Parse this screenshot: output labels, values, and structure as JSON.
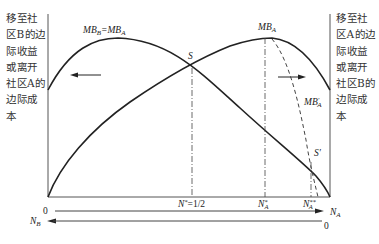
{
  "diagram": {
    "left_axis_label": "移至社区B的边际收益或离开社区A的边际成本",
    "right_axis_label": "移至社区A的边际收益或离开社区B的边际成本",
    "curves": [
      {
        "name": "MB_B=MB_A",
        "label": "MBB=MBA",
        "style": "solid"
      },
      {
        "name": "MB_A",
        "label": "MBA",
        "style": "solid"
      },
      {
        "name": "MB_A'",
        "label": "MB'A",
        "style": "dashed"
      }
    ],
    "points": {
      "S": "S",
      "S_prime": "S'"
    },
    "x_marks": {
      "n_star": "N*=1/2",
      "na_star": "N*A",
      "na_double_star": "N**A"
    },
    "axes": {
      "na_axis": {
        "origin": "0",
        "label": "NA",
        "direction": "right"
      },
      "nb_axis": {
        "origin": "0",
        "label": "NB",
        "direction": "left"
      }
    },
    "arrows": [
      "left arrow toward community B",
      "right arrow toward community A"
    ],
    "caption": ""
  },
  "labels": {
    "mbb_eq_mba_main": "MB",
    "mbb_sub": "B",
    "eq": "=MB",
    "mba_sub": "A",
    "mba_main": "MB",
    "mba_top_sub": "A",
    "mbap_main": "MB",
    "mbap_sup": "′",
    "mbap_sub": "A",
    "s": "S",
    "s_prime": "S′",
    "n_star": "N",
    "n_star_sup": "*",
    "n_star_val": "=1/2",
    "na_star": "N",
    "na_star_sup": "*",
    "na_star_sub": "A",
    "na2_star": "N",
    "na2_star_sup": "**",
    "na2_star_sub": "A",
    "zero_left": "0",
    "zero_right": "0",
    "na_axis": "N",
    "na_axis_sub": "A",
    "nb_axis": "N",
    "nb_axis_sub": "B"
  }
}
